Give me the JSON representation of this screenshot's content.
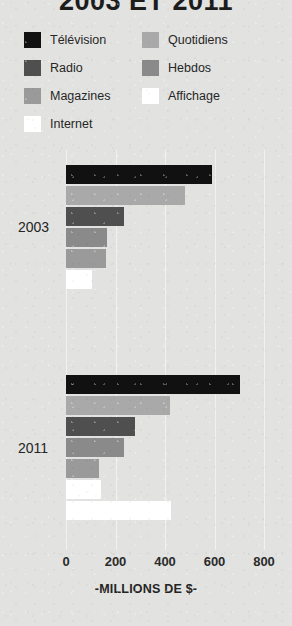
{
  "chart_data": {
    "type": "bar",
    "orientation": "horizontal",
    "title": "2003 ET 2011",
    "xlabel": "-MILLIONS DE $-",
    "ylabel": "",
    "xlim": [
      0,
      800
    ],
    "xticks": [
      0,
      200,
      400,
      600,
      800
    ],
    "xtick_labels": [
      "0",
      "200",
      "400",
      "600",
      "800"
    ],
    "grid": true,
    "legend_position": "top",
    "categories": [
      "2003",
      "2011"
    ],
    "series": [
      {
        "name": "Télévision",
        "color": "#111111",
        "values": [
          590,
          705
        ]
      },
      {
        "name": "Quotidiens",
        "color": "#a9a9a9",
        "values": [
          480,
          420
        ]
      },
      {
        "name": "Radio",
        "color": "#4f4f4f",
        "values": [
          235,
          280
        ]
      },
      {
        "name": "Hebdos",
        "color": "#8a8a8a",
        "values": [
          165,
          235
        ]
      },
      {
        "name": "Magazines",
        "color": "#9a9a9a",
        "values": [
          160,
          135
        ]
      },
      {
        "name": "Affichage",
        "color": "#ffffff",
        "values": [
          105,
          140
        ]
      },
      {
        "name": "Internet",
        "color": "#ffffff",
        "values": [
          0,
          425
        ]
      }
    ]
  },
  "legend": {
    "items": [
      {
        "label": "Télévision",
        "color": "#111111"
      },
      {
        "label": "Quotidiens",
        "color": "#a9a9a9"
      },
      {
        "label": "Radio",
        "color": "#4f4f4f"
      },
      {
        "label": "Hebdos",
        "color": "#8a8a8a"
      },
      {
        "label": "Magazines",
        "color": "#9a9a9a"
      },
      {
        "label": "Affichage",
        "color": "#ffffff"
      },
      {
        "label": "Internet",
        "color": "#ffffff"
      }
    ]
  },
  "groups": [
    {
      "label": "2003",
      "bars": [
        {
          "series": "Télévision",
          "value": 590,
          "color": "#111111"
        },
        {
          "series": "Quotidiens",
          "value": 480,
          "color": "#a9a9a9"
        },
        {
          "series": "Radio",
          "value": 235,
          "color": "#4f4f4f"
        },
        {
          "series": "Hebdos",
          "value": 165,
          "color": "#8a8a8a"
        },
        {
          "series": "Magazines",
          "value": 160,
          "color": "#9a9a9a"
        },
        {
          "series": "Affichage",
          "value": 105,
          "color": "#ffffff"
        }
      ]
    },
    {
      "label": "2011",
      "bars": [
        {
          "series": "Télévision",
          "value": 705,
          "color": "#111111"
        },
        {
          "series": "Quotidiens",
          "value": 420,
          "color": "#a9a9a9"
        },
        {
          "series": "Radio",
          "value": 280,
          "color": "#4f4f4f"
        },
        {
          "series": "Hebdos",
          "value": 235,
          "color": "#8a8a8a"
        },
        {
          "series": "Magazines",
          "value": 135,
          "color": "#9a9a9a"
        },
        {
          "series": "Affichage",
          "value": 140,
          "color": "#ffffff"
        },
        {
          "series": "Internet",
          "value": 425,
          "color": "#ffffff"
        }
      ]
    }
  ],
  "axis": {
    "ticks": [
      "0",
      "200",
      "400",
      "600",
      "800"
    ],
    "caption": "-MILLIONS DE $-"
  }
}
